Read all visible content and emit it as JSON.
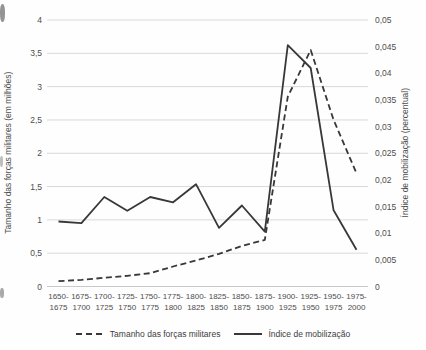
{
  "chart_data": {
    "type": "line",
    "title": "",
    "categories_line1": [
      "1650-",
      "1675-",
      "1700-",
      "1725-",
      "1750-",
      "1775-",
      "1800-",
      "1825-",
      "1850-",
      "1875-",
      "1900-",
      "1925-",
      "1950-",
      "1975-"
    ],
    "categories_line2": [
      "1675",
      "1700",
      "1725",
      "1750",
      "1775",
      "1800",
      "1825",
      "1850",
      "1875",
      "1900",
      "1925",
      "1950",
      "1975",
      "2000"
    ],
    "ylabel_left": "Tamanho das forças militares (em milhões)",
    "ylabel_right": "Índice de mobilização (percentual)",
    "y_left": {
      "min": 0,
      "max": 4,
      "step": 0.5,
      "tick_labels": [
        "0",
        "0,5",
        "1",
        "1,5",
        "2",
        "2,5",
        "3",
        "3,5",
        "4"
      ]
    },
    "y_right": {
      "min": 0,
      "max": 0.05,
      "step": 0.005,
      "tick_labels": [
        "0",
        "0,005",
        "0,01",
        "0,015",
        "0,02",
        "0,025",
        "0,03",
        "0,035",
        "0,04",
        "0,045",
        "0,05"
      ]
    },
    "series": [
      {
        "name": "Tamanho das forças militares",
        "axis": "left",
        "style": "dashed",
        "values": [
          0.08,
          0.1,
          0.13,
          0.16,
          0.2,
          0.3,
          0.39,
          0.49,
          0.61,
          0.7,
          2.85,
          3.55,
          2.5,
          1.7
        ]
      },
      {
        "name": "Índice de mobilização",
        "axis": "right",
        "style": "solid",
        "values": [
          0.0122,
          0.0119,
          0.0168,
          0.0142,
          0.0168,
          0.0158,
          0.0192,
          0.011,
          0.0152,
          0.0103,
          0.0453,
          0.041,
          0.0143,
          0.0069
        ]
      }
    ],
    "colors": {
      "line": "#383838",
      "grid": "#d9d9d9",
      "axis_line": "#c9c9c9",
      "text": "#4d4d4d",
      "background": "#fefefe"
    },
    "legend_position": "bottom",
    "grid": "horizontal, left-axis intervals only"
  }
}
